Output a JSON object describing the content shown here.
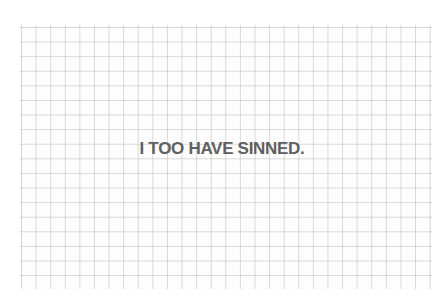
{
  "image": {
    "subject": "grid paper with printed text",
    "text": "I TOO HAVE SINNED.",
    "colors": {
      "paper": "#fdfdfd",
      "grid": "#c8c8c8",
      "text": "#5f5f5f"
    }
  }
}
